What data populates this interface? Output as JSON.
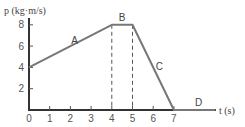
{
  "chart_data": {
    "type": "line",
    "title": "",
    "xlabel": "t (s)",
    "ylabel": "p (kg·m/s)",
    "xlim": [
      0,
      9.3
    ],
    "ylim": [
      0,
      9
    ],
    "xticks": [
      0,
      1,
      2,
      3,
      4,
      5,
      6,
      7
    ],
    "yticks": [
      2,
      4,
      6,
      8
    ],
    "grid": false,
    "series": [
      {
        "name": "momentum",
        "x": [
          0,
          4,
          5,
          7,
          9
        ],
        "y": [
          4,
          8,
          8,
          0,
          0
        ]
      }
    ],
    "segment_labels": [
      {
        "text": "A",
        "x": 2.2,
        "y": 6.2
      },
      {
        "text": "B",
        "x": 4.5,
        "y": 8.4
      },
      {
        "text": "C",
        "x": 6.3,
        "y": 3.8
      },
      {
        "text": "D",
        "x": 8.2,
        "y": 0.35
      }
    ],
    "dashed_verticals": [
      4,
      5
    ]
  }
}
